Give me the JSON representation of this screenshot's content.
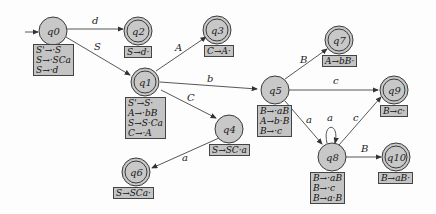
{
  "diagram": {
    "type": "LR automaton",
    "states": [
      {
        "id": "q0",
        "label": "q0",
        "accepting": false,
        "start": true,
        "items": [
          "S'→·S",
          "S→·SCa",
          "S→·d"
        ]
      },
      {
        "id": "q1",
        "label": "q1",
        "accepting": true,
        "items": [
          "S'→S·",
          "A→·bB",
          "S→S·Ca",
          "C→·A"
        ]
      },
      {
        "id": "q2",
        "label": "q2",
        "accepting": true,
        "items": [
          "S→d·"
        ]
      },
      {
        "id": "q3",
        "label": "q3",
        "accepting": true,
        "items": [
          "C→A·"
        ]
      },
      {
        "id": "q4",
        "label": "q4",
        "accepting": false,
        "items": [
          "S→SC·a"
        ]
      },
      {
        "id": "q5",
        "label": "q5",
        "accepting": false,
        "items": [
          "B→·aB",
          "A→b·B",
          "B→·c"
        ]
      },
      {
        "id": "q6",
        "label": "q6",
        "accepting": true,
        "items": [
          "S→SCa·"
        ]
      },
      {
        "id": "q7",
        "label": "q7",
        "accepting": true,
        "items": [
          "A→bB·"
        ]
      },
      {
        "id": "q8",
        "label": "q8",
        "accepting": false,
        "items": [
          "B→·aB",
          "B→·c",
          "B→a·B"
        ]
      },
      {
        "id": "q9",
        "label": "q9",
        "accepting": true,
        "items": [
          "B→c·"
        ]
      },
      {
        "id": "q10",
        "label": "q10",
        "accepting": true,
        "items": [
          "B→aB·"
        ]
      }
    ],
    "edges": [
      {
        "from": "q0",
        "to": "q2",
        "label": "d"
      },
      {
        "from": "q0",
        "to": "q1",
        "label": "S"
      },
      {
        "from": "q1",
        "to": "q3",
        "label": "A"
      },
      {
        "from": "q1",
        "to": "q5",
        "label": "b"
      },
      {
        "from": "q1",
        "to": "q4",
        "label": "C"
      },
      {
        "from": "q4",
        "to": "q6",
        "label": "a"
      },
      {
        "from": "q5",
        "to": "q7",
        "label": "B"
      },
      {
        "from": "q5",
        "to": "q9",
        "label": "c"
      },
      {
        "from": "q5",
        "to": "q8",
        "label": "a"
      },
      {
        "from": "q8",
        "to": "q8",
        "label": "a"
      },
      {
        "from": "q8",
        "to": "q9",
        "label": "c"
      },
      {
        "from": "q8",
        "to": "q10",
        "label": "B"
      }
    ]
  },
  "colors": {
    "state_fill": "#c8c8c8",
    "box_fill": "#c4c4c4",
    "stroke": "#3a3a3a"
  }
}
